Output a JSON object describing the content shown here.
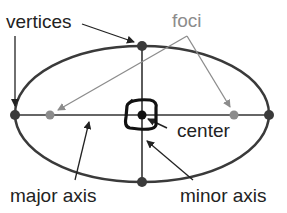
{
  "diagram": {
    "labels": {
      "vertices": "vertices",
      "foci": "foci",
      "center": "center",
      "major_axis": "major axis",
      "minor_axis": "minor axis"
    },
    "colors": {
      "outline": "#3a3a3a",
      "vertex": "#3a3a3a",
      "focus": "#8c8c8c",
      "foci_label": "#8c8c8c",
      "text": "#222222",
      "center_mark": "#111111"
    },
    "ellipse": {
      "cx": 142,
      "cy": 115,
      "rx": 127,
      "ry": 68
    },
    "points": {
      "vertices": [
        {
          "name": "left",
          "x": 15,
          "y": 115
        },
        {
          "name": "right",
          "x": 269,
          "y": 115
        },
        {
          "name": "top",
          "x": 142,
          "y": 46
        },
        {
          "name": "bottom",
          "x": 142,
          "y": 182
        }
      ],
      "foci": [
        {
          "name": "left-focus",
          "x": 50,
          "y": 115
        },
        {
          "name": "right-focus",
          "x": 234,
          "y": 115
        }
      ],
      "center": {
        "x": 142,
        "y": 115
      }
    }
  }
}
